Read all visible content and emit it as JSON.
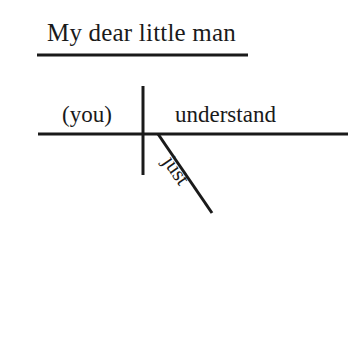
{
  "diagram": {
    "type": "reed-kellogg-sentence-diagram",
    "ink_color": "#1a1a1a",
    "background_color": "#ffffff",
    "title": {
      "text": "My dear little man",
      "role": "noun-of-direct-address"
    },
    "subject": {
      "text": "(you)",
      "role": "implied-subject"
    },
    "verb": {
      "text": "understand",
      "role": "predicate-verb"
    },
    "modifier": {
      "text": "just",
      "role": "adverb",
      "attaches_to": "verb"
    },
    "lines": {
      "title_underline": {
        "x1": 37,
        "y1": 55,
        "x2": 248,
        "y2": 55
      },
      "baseline": {
        "x1": 38,
        "y1": 134,
        "x2": 348,
        "y2": 134
      },
      "subject_verb_divider": {
        "x1": 143,
        "y1": 86,
        "x2": 143,
        "y2": 175
      },
      "modifier_slant": {
        "x1": 158,
        "y1": 134,
        "x2": 212,
        "y2": 213
      }
    }
  }
}
